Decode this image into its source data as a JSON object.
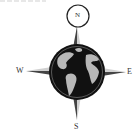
{
  "compass": {
    "north_label": "N",
    "south_label": "S",
    "east_label": "E",
    "west_label": "W"
  },
  "colors": {
    "globe_ocean": "#111111",
    "globe_land": "#b8b8b8",
    "needle_dark": "#555555",
    "needle_light": "#cfcfcf",
    "ring": "#222222",
    "background": "#ffffff"
  }
}
